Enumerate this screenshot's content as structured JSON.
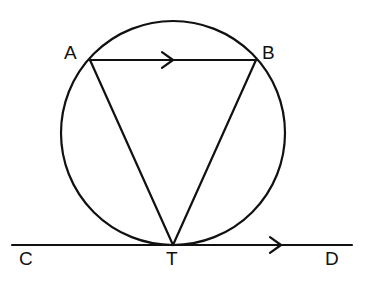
{
  "figure": {
    "background_color": "#ffffff",
    "stroke_color": "#111111",
    "stroke_width": 2.2,
    "width": 366,
    "height": 282
  },
  "circle": {
    "name": "circumscribed-circle",
    "center_x": 173,
    "center_y": 133,
    "radius": 112,
    "fill": "none"
  },
  "points": {
    "A": {
      "label": "A",
      "x": 90,
      "y": 60,
      "label_x": 64,
      "label_y": 43
    },
    "B": {
      "label": "B",
      "x": 256,
      "y": 60,
      "label_x": 262,
      "label_y": 43
    },
    "T": {
      "label": "T",
      "x": 173,
      "y": 245,
      "label_x": 166,
      "label_y": 249
    },
    "C": {
      "label": "C",
      "x": 12,
      "y": 245,
      "label_x": 19,
      "label_y": 249
    },
    "D": {
      "label": "D",
      "x": 352,
      "y": 245,
      "label_x": 325,
      "label_y": 249
    }
  },
  "segments": [
    {
      "name": "chord-ab",
      "from": "A",
      "to": "B",
      "x1": 90,
      "y1": 60,
      "x2": 256,
      "y2": 60,
      "arrow": true,
      "arrow_x": 173,
      "arrow_y": 60
    },
    {
      "name": "side-at",
      "from": "A",
      "to": "T",
      "x1": 90,
      "y1": 60,
      "x2": 173,
      "y2": 245,
      "arrow": false
    },
    {
      "name": "side-bt",
      "from": "B",
      "to": "T",
      "x1": 256,
      "y1": 60,
      "x2": 173,
      "y2": 245,
      "arrow": false
    },
    {
      "name": "tangent-cd",
      "from": "C",
      "to": "D",
      "x1": 12,
      "y1": 245,
      "x2": 352,
      "y2": 245,
      "arrow": true,
      "arrow_x": 281,
      "arrow_y": 245
    }
  ],
  "arrow_markers": [
    {
      "name": "arrow-marker-ab",
      "cx": 173,
      "cy": 60,
      "size": 11
    },
    {
      "name": "arrow-marker-cd",
      "cx": 281,
      "cy": 245,
      "size": 11
    }
  ]
}
